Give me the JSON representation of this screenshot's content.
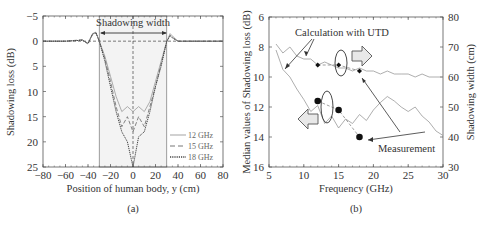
{
  "chart_data": [
    {
      "panel": "(a)",
      "type": "line",
      "title": "",
      "xlabel": "Position of human body, y (cm)",
      "ylabel": "Shadowing loss (dB)",
      "xlim": [
        -80,
        80
      ],
      "ylim": [
        -5,
        25
      ],
      "y_inverted": true,
      "xticks": [
        -80,
        -60,
        -40,
        -20,
        0,
        20,
        40,
        60,
        80
      ],
      "yticks": [
        -5,
        0,
        5,
        10,
        15,
        20,
        25
      ],
      "annotations": [
        "Shadowing width"
      ],
      "shaded_region_x": [
        -30,
        30
      ],
      "legend": [
        "12 GHz",
        "15 GHz",
        "18 GHz"
      ],
      "legend_position": "lower right",
      "series": [
        {
          "name": "12 GHz",
          "style": "solid",
          "x": [
            -80,
            -60,
            -45,
            -40,
            -36,
            -33,
            -30,
            -25,
            -20,
            -15,
            -10,
            -5,
            0,
            5,
            10,
            15,
            20,
            25,
            30,
            33,
            36,
            40,
            50,
            60,
            80
          ],
          "y": [
            0,
            0,
            -0.2,
            0.5,
            -1.5,
            -1.8,
            0,
            3,
            7,
            11,
            14,
            13,
            14,
            13,
            14,
            12,
            8,
            4,
            0,
            -1.5,
            -0.8,
            0,
            0,
            0,
            0
          ]
        },
        {
          "name": "15 GHz",
          "style": "dashed",
          "x": [
            -80,
            -60,
            -45,
            -40,
            -36,
            -33,
            -30,
            -25,
            -20,
            -15,
            -10,
            -5,
            0,
            5,
            10,
            15,
            20,
            25,
            30,
            33,
            36,
            40,
            50,
            60,
            80
          ],
          "y": [
            0,
            0,
            -0.3,
            0.6,
            -1.3,
            -1.6,
            0,
            3.5,
            8,
            13,
            17,
            15,
            18,
            15,
            17,
            13,
            9,
            4.5,
            0,
            -1.2,
            -0.6,
            0,
            0,
            0,
            0
          ]
        },
        {
          "name": "18 GHz",
          "style": "dotted",
          "x": [
            -80,
            -60,
            -45,
            -40,
            -36,
            -33,
            -30,
            -25,
            -20,
            -15,
            -10,
            -5,
            0,
            5,
            10,
            15,
            20,
            25,
            30,
            33,
            36,
            40,
            50,
            60,
            80
          ],
          "y": [
            0,
            0,
            -0.2,
            0.4,
            -1.4,
            -1.7,
            0,
            4,
            9,
            14,
            18,
            20,
            25,
            19,
            18,
            14,
            9,
            5,
            0,
            -1,
            -0.5,
            0,
            0,
            0,
            0
          ]
        }
      ]
    },
    {
      "panel": "(b)",
      "type": "line",
      "title": "",
      "xlabel": "Frequency (GHz)",
      "ylabel": "Median values of Shadowing loss (dB)",
      "ylabel_right": "Shadowing width (cm)",
      "xlim": [
        5,
        30
      ],
      "ylim": [
        6,
        16
      ],
      "y_inverted": true,
      "ylim_right": [
        30,
        80
      ],
      "xticks": [
        5,
        10,
        15,
        20,
        25,
        30
      ],
      "yticks": [
        6,
        8,
        10,
        12,
        14,
        16
      ],
      "yticks_right": [
        30,
        40,
        50,
        60,
        70,
        80
      ],
      "annotations": [
        "Calculation with UTD",
        "Measurement"
      ],
      "series": [
        {
          "name": "Calculation with UTD - Shadowing loss",
          "axis": "left",
          "style": "solid",
          "x": [
            6,
            7,
            8,
            9,
            10,
            11,
            12,
            13,
            14,
            15,
            16,
            17,
            18,
            19,
            20,
            21,
            22,
            23,
            24,
            25,
            26,
            27,
            28,
            29,
            30
          ],
          "y": [
            8.2,
            9.5,
            10.0,
            10.8,
            11.5,
            12.3,
            11.9,
            13.1,
            12.6,
            13.4,
            12.8,
            13.1,
            12.5,
            12.9,
            12.2,
            11.7,
            11.3,
            11.6,
            12.0,
            12.3,
            12.0,
            12.6,
            13.0,
            13.6,
            13.9
          ]
        },
        {
          "name": "Calculation with UTD - Shadowing width",
          "axis": "right",
          "style": "solid",
          "x": [
            6,
            7,
            8,
            9,
            10,
            11,
            12,
            13,
            14,
            15,
            16,
            17,
            18,
            19,
            20,
            21,
            22,
            23,
            24,
            25,
            26,
            27,
            28,
            29,
            30
          ],
          "y": [
            71,
            68,
            70,
            67,
            66,
            66,
            64,
            65,
            64,
            63,
            63,
            62,
            63,
            62,
            62,
            61,
            62,
            61,
            61,
            61,
            60,
            61,
            60,
            60,
            60
          ]
        },
        {
          "name": "Measurement - Shadowing loss",
          "axis": "left",
          "marker": "circle",
          "x": [
            12,
            15,
            18
          ],
          "y": [
            11.6,
            12.2,
            14.0
          ]
        },
        {
          "name": "Measurement - Shadowing width",
          "axis": "right",
          "marker": "diamond",
          "x": [
            12,
            15,
            18
          ],
          "y": [
            64,
            64,
            62
          ]
        }
      ]
    }
  ],
  "captions": {
    "a": "(a)",
    "b": "(b)"
  },
  "labels": {
    "a_xlabel": "Position of human body, y (cm)",
    "a_ylabel": "Shadowing loss (dB)",
    "a_annotation": "Shadowing width",
    "b_xlabel": "Frequency (GHz)",
    "b_ylabel": "Median values of Shadowing loss (dB)",
    "b_ylabel_right": "Shadowing width (cm)",
    "b_annotation_calc": "Calculation with UTD",
    "b_annotation_meas": "Measurement"
  }
}
